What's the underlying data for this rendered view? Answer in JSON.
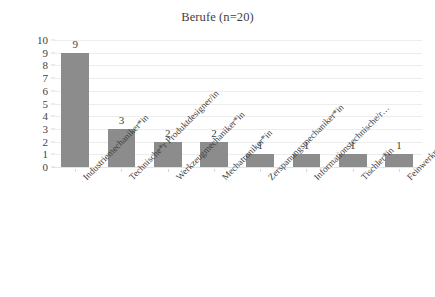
{
  "chart_data": {
    "type": "bar",
    "title": "Berufe (n=20)",
    "xlabel": "",
    "ylabel": "",
    "ylim": [
      0,
      10
    ],
    "yticks": [
      0,
      1,
      2,
      3,
      4,
      5,
      6,
      7,
      8,
      9,
      10
    ],
    "grid": true,
    "legend": false,
    "bar_color": "#8c8c8c",
    "categories": [
      "Industriemechaniker*in",
      "Technische*r Produktdesigner/in",
      "Werkzeugmechaniker*in",
      "Mechatroniker*in",
      "Zerspanungsmechaniker*in",
      "Informationstechnische/r…",
      "Tischler*in",
      "Feinwerkmechaniker*in"
    ],
    "values": [
      9,
      3,
      2,
      2,
      1,
      1,
      1,
      1
    ],
    "data_labels": [
      "9",
      "3",
      "2",
      "2",
      "1",
      "1",
      "1",
      "1"
    ],
    "ytick_labels": [
      "0",
      "1",
      "2",
      "3",
      "4",
      "5",
      "6",
      "7",
      "8",
      "9",
      "10"
    ]
  }
}
